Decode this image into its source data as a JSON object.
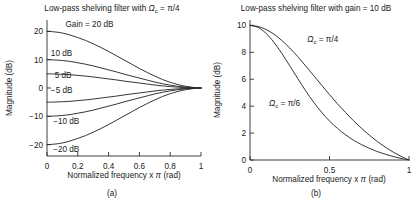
{
  "figure": {
    "panels": [
      {
        "caption": "(a)",
        "title_prefix": "Low-pass shelving filter with ",
        "title_symbol": "Ω",
        "title_subscript": "c",
        "title_suffix": " = π/4",
        "title_full": "Low-pass shelving filter with Ωc = π/4"
      },
      {
        "caption": "(b)",
        "title_prefix": "Low-pass shelving filter with gain = 10 dB",
        "title_symbol": "",
        "title_subscript": "",
        "title_suffix": "",
        "title_full": "Low-pass shelving filter with gain = 10 dB"
      }
    ]
  },
  "chart_data": [
    {
      "type": "line",
      "title": "Low-pass shelving filter with Ωc = π/4",
      "xlabel": "Normalized frequency x π (rad)",
      "ylabel": "Magnitude (dB)",
      "xlim": [
        0,
        1
      ],
      "ylim": [
        -24,
        24
      ],
      "xticks": [
        0,
        0.2,
        0.4,
        0.6,
        0.8,
        1
      ],
      "xticklabels": [
        "0",
        "0.2",
        "0.4",
        "0.6",
        "0.8",
        "1"
      ],
      "yticks": [
        -20,
        -10,
        0,
        10,
        20
      ],
      "yticklabels": [
        "−20",
        "−10",
        "0",
        "10",
        "20"
      ],
      "grid": false,
      "legend": "inline-annotations",
      "x": [
        0,
        0.05,
        0.1,
        0.15,
        0.2,
        0.25,
        0.3,
        0.35,
        0.4,
        0.45,
        0.5,
        0.55,
        0.6,
        0.65,
        0.7,
        0.75,
        0.8,
        0.85,
        0.9,
        0.95,
        1
      ],
      "series": [
        {
          "name": "Gain = 20 dB",
          "label": "Gain = 20 dB",
          "label_x": 0.12,
          "label_y": 22.5,
          "values": [
            20.0,
            19.8,
            19.4,
            18.7,
            17.8,
            16.8,
            15.6,
            14.3,
            12.9,
            11.4,
            9.9,
            8.4,
            6.9,
            5.5,
            4.2,
            3.0,
            2.0,
            1.2,
            0.6,
            0.2,
            0.0
          ]
        },
        {
          "name": "10 dB",
          "label": "10 dB",
          "label_x": 0.025,
          "label_y": 12.5,
          "values": [
            10.0,
            9.9,
            9.7,
            9.4,
            8.9,
            8.4,
            7.8,
            7.1,
            6.4,
            5.7,
            4.9,
            4.2,
            3.5,
            2.8,
            2.1,
            1.5,
            1.0,
            0.6,
            0.3,
            0.1,
            0.0
          ]
        },
        {
          "name": "5 dB",
          "label": "5 dB",
          "label_x": 0.05,
          "label_y": 4.6,
          "values": [
            5.0,
            4.95,
            4.85,
            4.7,
            4.45,
            4.2,
            3.9,
            3.55,
            3.2,
            2.85,
            2.45,
            2.1,
            1.75,
            1.4,
            1.05,
            0.75,
            0.5,
            0.3,
            0.15,
            0.05,
            0.0
          ]
        },
        {
          "name": "−5 dB",
          "label": "−5 dB",
          "label_x": 0.025,
          "label_y": -0.8,
          "values": [
            -5.0,
            -4.95,
            -4.85,
            -4.7,
            -4.45,
            -4.2,
            -3.9,
            -3.55,
            -3.2,
            -2.85,
            -2.45,
            -2.1,
            -1.75,
            -1.4,
            -1.05,
            -0.75,
            -0.5,
            -0.3,
            -0.15,
            -0.05,
            0.0
          ]
        },
        {
          "name": "−10 dB",
          "label": "−10 dB",
          "label_x": 0.04,
          "label_y": -11.6,
          "values": [
            -10.0,
            -9.9,
            -9.7,
            -9.4,
            -8.9,
            -8.4,
            -7.8,
            -7.1,
            -6.4,
            -5.7,
            -4.9,
            -4.2,
            -3.5,
            -2.8,
            -2.1,
            -1.5,
            -1.0,
            -0.6,
            -0.3,
            -0.1,
            0.0
          ]
        },
        {
          "name": "−20 dB",
          "label": "−20 dB",
          "label_x": 0.04,
          "label_y": -21.6,
          "values": [
            -20.0,
            -19.8,
            -19.4,
            -18.7,
            -17.8,
            -16.8,
            -15.6,
            -14.3,
            -12.9,
            -11.4,
            -9.9,
            -8.4,
            -6.9,
            -5.5,
            -4.2,
            -3.0,
            -2.0,
            -1.2,
            -0.6,
            -0.2,
            0.0
          ]
        }
      ]
    },
    {
      "type": "line",
      "title": "Low-pass shelving filter with gain = 10 dB",
      "xlabel": "Normalized frequency x π (rad)",
      "ylabel": "Magnitude (dB)",
      "xlim": [
        0,
        1
      ],
      "ylim": [
        0,
        10.4
      ],
      "xticks": [
        0,
        0.5,
        1
      ],
      "xticklabels": [
        "0",
        "0.5",
        "1"
      ],
      "yticks": [
        0,
        2,
        4,
        6,
        8,
        10
      ],
      "yticklabels": [
        "0",
        "2",
        "4",
        "6",
        "8",
        "10"
      ],
      "grid": false,
      "legend": "inline-annotations",
      "x": [
        0,
        0.05,
        0.1,
        0.15,
        0.2,
        0.25,
        0.3,
        0.35,
        0.4,
        0.45,
        0.5,
        0.55,
        0.6,
        0.65,
        0.7,
        0.75,
        0.8,
        0.85,
        0.9,
        0.95,
        1
      ],
      "series": [
        {
          "name": "Ωc = π/4",
          "label": "Ω",
          "label_sub": "c",
          "label_rest": " = π/4",
          "label_x": 0.36,
          "label_y": 9.0,
          "values": [
            10.0,
            9.92,
            9.7,
            9.35,
            8.88,
            8.32,
            7.68,
            6.99,
            6.28,
            5.56,
            4.86,
            4.18,
            3.54,
            2.93,
            2.37,
            1.85,
            1.38,
            0.96,
            0.59,
            0.27,
            0.0
          ]
        },
        {
          "name": "Ωc = π/6",
          "label": "Ω",
          "label_sub": "c",
          "label_rest": " = π/6",
          "label_x": 0.12,
          "label_y": 4.2,
          "values": [
            10.0,
            9.85,
            9.42,
            8.75,
            7.92,
            7.0,
            6.06,
            5.14,
            4.3,
            3.55,
            2.9,
            2.35,
            1.88,
            1.48,
            1.15,
            0.87,
            0.63,
            0.43,
            0.26,
            0.12,
            0.0
          ]
        }
      ]
    }
  ]
}
